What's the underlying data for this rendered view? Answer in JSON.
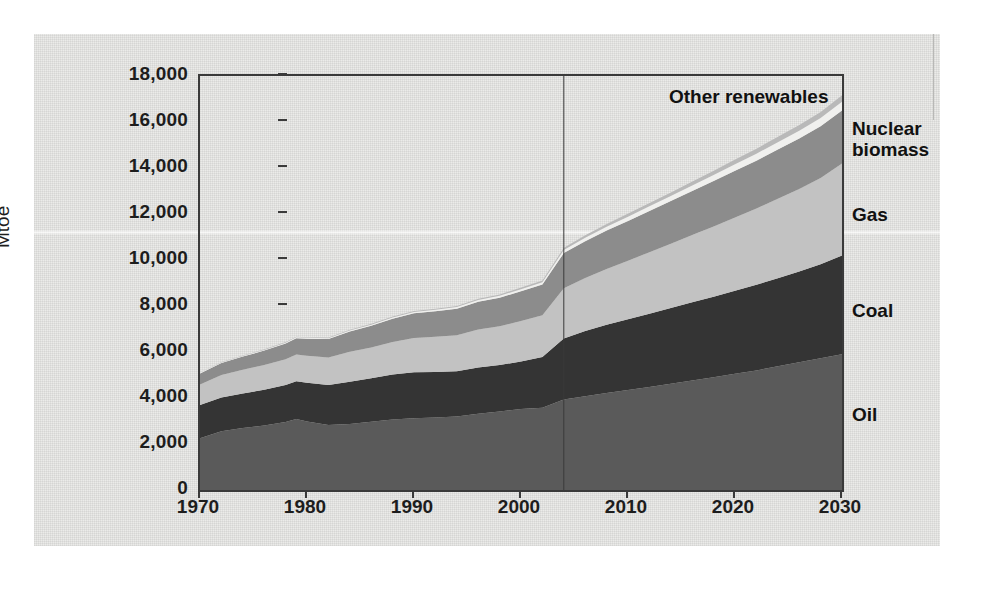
{
  "figure": {
    "y_axis_title": "Mtoe",
    "inplot_label": "Other renewables"
  },
  "y_axis": {
    "ticks": [
      "0",
      "2,000",
      "4,000",
      "6,000",
      "8,000",
      "10,000",
      "12,000",
      "14,000",
      "16,000",
      "18,000"
    ],
    "values": [
      0,
      2000,
      4000,
      6000,
      8000,
      10000,
      12000,
      14000,
      16000,
      18000
    ]
  },
  "x_axis": {
    "ticks": [
      "1970",
      "1980",
      "1990",
      "2000",
      "2010",
      "2020",
      "2030"
    ],
    "values": [
      1970,
      1980,
      1990,
      2000,
      2010,
      2020,
      2030
    ]
  },
  "series_labels": [
    {
      "key": "nuclear_biomass",
      "line1": "Nuclear",
      "line2": "biomass",
      "top": 118
    },
    {
      "key": "gas",
      "line1": "Gas",
      "line2": "",
      "top": 204
    },
    {
      "key": "coal",
      "line1": "Coal",
      "line2": "",
      "top": 300
    },
    {
      "key": "oil",
      "line1": "Oil",
      "line2": "",
      "top": 404
    }
  ],
  "colors": {
    "oil": "#5a5a5a",
    "coal": "#343434",
    "gas": "#c2c2c2",
    "nuclear_biomass": "#8c8c8c",
    "other_renewables": "#b9b9b9",
    "gap": "#f0f0ee",
    "axis": "#3a3a3a",
    "paper": "#e9e9e7",
    "text": "#1d1d1d"
  },
  "projection": {
    "divider_year": 2004,
    "label": ""
  },
  "chart_data": {
    "type": "area",
    "title": "",
    "subtitle": "",
    "xlabel": "",
    "ylabel": "Mtoe",
    "xlim": [
      1970,
      2030
    ],
    "ylim": [
      0,
      18000
    ],
    "grid": false,
    "legend_position": "right-outside",
    "stacked": true,
    "stack_order_bottom_to_top": [
      "Oil",
      "Coal",
      "Gas",
      "Nuclear biomass",
      "Other renewables"
    ],
    "annotations": [
      {
        "text": "Other renewables",
        "type": "in-plot-label"
      },
      {
        "text": "Nuclear biomass",
        "type": "right-label"
      },
      {
        "text": "Gas",
        "type": "right-label"
      },
      {
        "text": "Coal",
        "type": "right-label"
      },
      {
        "text": "Oil",
        "type": "right-label"
      },
      {
        "text": "projection divider at 2004",
        "type": "vline"
      }
    ],
    "x": [
      1970,
      1972,
      1974,
      1976,
      1978,
      1979,
      1980,
      1982,
      1984,
      1986,
      1988,
      1990,
      1992,
      1994,
      1996,
      1998,
      2000,
      2002,
      2004,
      2006,
      2008,
      2010,
      2012,
      2014,
      2016,
      2018,
      2020,
      2022,
      2024,
      2026,
      2028,
      2030
    ],
    "series": [
      {
        "name": "Oil",
        "color": "#5a5a5a",
        "values": [
          2250,
          2550,
          2700,
          2800,
          2960,
          3090,
          2980,
          2830,
          2870,
          2970,
          3060,
          3120,
          3150,
          3200,
          3320,
          3410,
          3520,
          3580,
          3940,
          4080,
          4220,
          4350,
          4480,
          4620,
          4760,
          4900,
          5050,
          5200,
          5380,
          5550,
          5730,
          5900
        ]
      },
      {
        "name": "Coal",
        "color": "#343434",
        "values": [
          1450,
          1470,
          1500,
          1560,
          1600,
          1640,
          1680,
          1730,
          1840,
          1890,
          1960,
          2000,
          1980,
          1960,
          2010,
          2020,
          2070,
          2200,
          2650,
          2830,
          2960,
          3070,
          3180,
          3290,
          3400,
          3500,
          3610,
          3720,
          3830,
          3950,
          4080,
          4300
        ]
      },
      {
        "name": "Gas",
        "color": "#c2c2c2",
        "values": [
          890,
          980,
          1030,
          1080,
          1130,
          1160,
          1180,
          1200,
          1300,
          1340,
          1420,
          1490,
          1530,
          1570,
          1650,
          1690,
          1760,
          1820,
          2180,
          2310,
          2430,
          2550,
          2680,
          2800,
          2930,
          3060,
          3190,
          3320,
          3450,
          3590,
          3750,
          4000
        ]
      },
      {
        "name": "Nuclear biomass",
        "color": "#8c8c8c",
        "values": [
          480,
          520,
          570,
          620,
          680,
          710,
          740,
          800,
          880,
          940,
          1010,
          1070,
          1110,
          1150,
          1200,
          1240,
          1290,
          1330,
          1530,
          1600,
          1670,
          1730,
          1790,
          1850,
          1910,
          1970,
          2030,
          2080,
          2140,
          2190,
          2250,
          2300
        ]
      },
      {
        "name": "Other renewables",
        "color": "#b9b9b9",
        "values": [
          40,
          45,
          50,
          55,
          60,
          62,
          65,
          70,
          80,
          85,
          95,
          105,
          115,
          125,
          135,
          145,
          160,
          175,
          230,
          260,
          290,
          320,
          350,
          380,
          415,
          450,
          485,
          520,
          555,
          590,
          625,
          660
        ]
      }
    ],
    "totals": [
      5110,
      5565,
      5850,
      6115,
      6430,
      6662,
      6645,
      6630,
      6970,
      7225,
      7545,
      7785,
      7885,
      8005,
      8315,
      8505,
      8800,
      9105,
      10530,
      11080,
      11570,
      12020,
      12480,
      12940,
      13415,
      13880,
      14365,
      14840,
      15355,
      15870,
      16435,
      17160
    ]
  }
}
